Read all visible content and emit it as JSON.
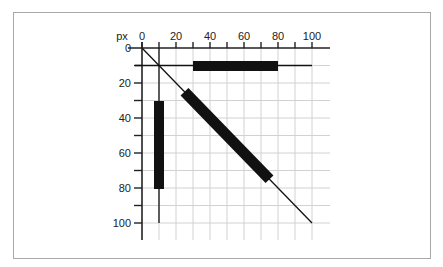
{
  "diagram": {
    "unit_label": "px",
    "x_ticks": [
      "0",
      "20",
      "40",
      "60",
      "80",
      "100"
    ],
    "y_ticks": [
      "0",
      "20",
      "40",
      "60",
      "80",
      "100"
    ],
    "colors": {
      "frame": "#a8a8a8",
      "grid": "#d2d2d2",
      "axis": "#222222",
      "shape": "#111111"
    },
    "shapes": [
      {
        "name": "horizontal-line",
        "from": [
          0,
          10
        ],
        "to": [
          100,
          10
        ],
        "thick_from": [
          30,
          10
        ],
        "thick_to": [
          80,
          10
        ]
      },
      {
        "name": "vertical-line",
        "from": [
          10,
          0
        ],
        "to": [
          10,
          100
        ],
        "thick_from": [
          10,
          30
        ],
        "thick_to": [
          10,
          80
        ]
      },
      {
        "name": "diagonal-line",
        "from": [
          0,
          0
        ],
        "to": [
          100,
          100
        ],
        "thick_from": [
          25,
          25
        ],
        "thick_to": [
          75,
          75
        ]
      }
    ]
  }
}
